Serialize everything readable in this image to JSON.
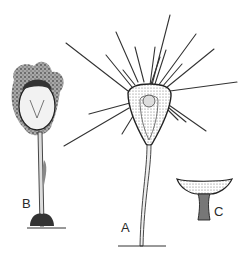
{
  "figure": {
    "panels": [
      {
        "id": "A",
        "label": "A",
        "description": "Suctorian ciliate with radiating tentacles on a long stalk"
      },
      {
        "id": "B",
        "label": "B",
        "description": "Specimen covered with debris on stalk"
      },
      {
        "id": "C",
        "label": "C",
        "description": "Cup-shaped lorica/base detail"
      }
    ]
  },
  "colors": {
    "ink": "#2a2a2a",
    "background": "#ffffff"
  }
}
